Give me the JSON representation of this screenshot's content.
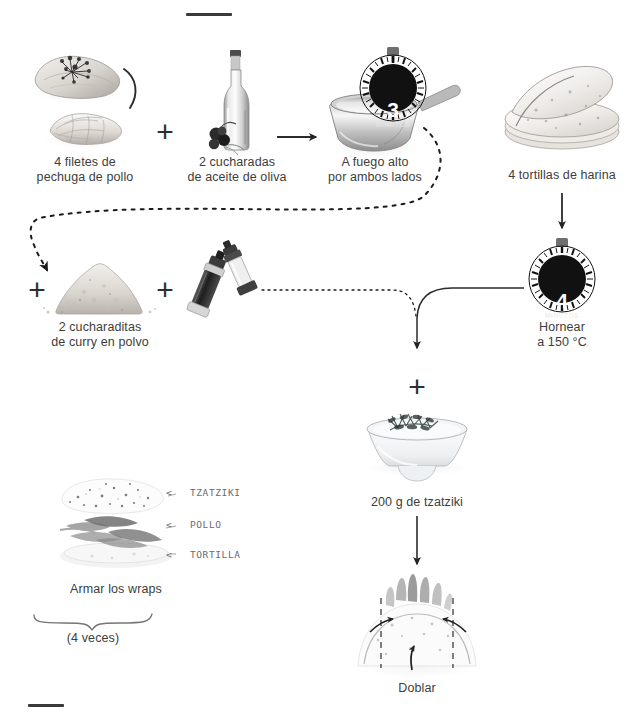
{
  "page": {
    "language": "es",
    "background_color": "#ffffff",
    "text_color": "#3d3d3d",
    "accent_color": "#1a1a1a"
  },
  "rules": {
    "top_rule": "",
    "bottom_rule": ""
  },
  "steps": [
    {
      "id": "chicken",
      "icon": "chicken-breast-icon",
      "caption": "4 filetes de\npechuga de pollo"
    },
    {
      "id": "olive-oil",
      "icon": "olive-oil-bottle-icon",
      "caption": "2 cucharadas\nde aceite de oliva"
    },
    {
      "id": "pan",
      "icon": "frying-pan-icon",
      "caption": "A fuego alto\npor ambos lados"
    },
    {
      "id": "tortillas",
      "icon": "tortilla-stack-icon",
      "caption": "4 tortillas de harina"
    },
    {
      "id": "curry",
      "icon": "curry-powder-icon",
      "caption": "2 cucharaditas\nde curry en polvo"
    },
    {
      "id": "salt-pepper",
      "icon": "salt-pepper-mill-icon",
      "caption": ""
    },
    {
      "id": "oven",
      "icon": "timer-icon",
      "caption": "Hornear\na 150 °C"
    },
    {
      "id": "tzatziki",
      "icon": "tzatziki-bowl-icon",
      "caption": "200 g de tzatziki"
    },
    {
      "id": "assemble",
      "icon": "wrap-layers-icon",
      "caption": "Armar los wraps"
    },
    {
      "id": "fold",
      "icon": "folding-wrap-icon",
      "caption": "Doblar"
    }
  ],
  "timers": [
    {
      "id": "pan-timer",
      "value": "3",
      "unit": "MINUTOS"
    },
    {
      "id": "oven-timer",
      "value": "4",
      "unit": "MINUTOS"
    }
  ],
  "plus_signs": [
    {
      "id": "plus-chicken-oil",
      "symbol": "+"
    },
    {
      "id": "plus-curry",
      "symbol": "+"
    },
    {
      "id": "plus-salt-pepper",
      "symbol": "+"
    },
    {
      "id": "plus-tzatziki",
      "symbol": "+"
    }
  ],
  "layer_labels": [
    {
      "id": "tzatziki",
      "marker": "<",
      "text": "TZATZIKI"
    },
    {
      "id": "pollo",
      "marker": "<",
      "text": "POLLO"
    },
    {
      "id": "tortilla",
      "marker": "<",
      "text": "TORTILLA"
    }
  ],
  "repeat_note": "(4 veces)",
  "captions": {
    "chicken": "4 filetes de\npechuga de pollo",
    "olive_oil": "2 cucharadas\nde aceite de oliva",
    "pan": "A fuego alto\npor ambos lados",
    "tortillas": "4 tortillas de harina",
    "curry": "2 cucharaditas\nde curry en polvo",
    "oven": "Hornear\na 150 °C",
    "tzatziki": "200 g de tzatziki",
    "assemble": "Armar los wraps",
    "fold": "Doblar"
  }
}
